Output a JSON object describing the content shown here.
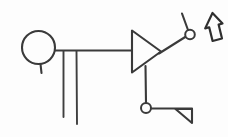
{
  "image": {
    "title": "Hand-drawn schematic sketch",
    "width": 228,
    "height": 137,
    "background_color": "#fdfdfd",
    "ink_color": "#3a3a3a"
  },
  "diagram": {
    "style": "hand-drawn line schematic",
    "elements": [
      {
        "id": "source-circle",
        "name": "circle-source-symbol",
        "label": "",
        "shape": "circle",
        "cx": 38.5,
        "cy": 47.5,
        "r": 16.5
      },
      {
        "id": "source-stub",
        "name": "circle-bottom-stub",
        "label": "",
        "shape": "line",
        "x1": 40.5,
        "y1": 64.0,
        "x2": 41.5,
        "y2": 73.0
      },
      {
        "id": "main-wire",
        "name": "horizontal-main-wire",
        "label": "",
        "shape": "line",
        "x1": 55.0,
        "y1": 50.5,
        "x2": 132.0,
        "y2": 50.5
      },
      {
        "id": "leg-left",
        "name": "vertical-leg-left",
        "label": "",
        "shape": "line",
        "x1": 63.5,
        "y1": 51.0,
        "x2": 63.5,
        "y2": 117.0
      },
      {
        "id": "leg-right",
        "name": "vertical-leg-right",
        "label": "",
        "shape": "line",
        "x1": 76.5,
        "y1": 51.0,
        "x2": 77.0,
        "y2": 124.0
      },
      {
        "id": "amplifier",
        "name": "amplifier-triangle",
        "label": "",
        "shape": "triangle",
        "points": "132,30.5 132,72.5 161,51.5"
      },
      {
        "id": "amp-out-diagonal",
        "name": "output-diagonal-wire",
        "label": "",
        "shape": "line",
        "x1": 159.0,
        "y1": 53.5,
        "x2": 186.0,
        "y2": 36.5
      },
      {
        "id": "top-node",
        "name": "output-node-circle",
        "label": "",
        "shape": "circle",
        "cx": 190.0,
        "cy": 34.5,
        "r": 4.8
      },
      {
        "id": "top-node-stub",
        "name": "output-node-upper-stub",
        "label": "",
        "shape": "line",
        "x1": 188.0,
        "y1": 30.0,
        "x2": 182.0,
        "y2": 13.5
      },
      {
        "id": "amp-down-wire",
        "name": "vertical-feedback-wire",
        "label": "",
        "shape": "line",
        "x1": 145.5,
        "y1": 66.0,
        "x2": 146.0,
        "y2": 103.0
      },
      {
        "id": "bottom-node",
        "name": "bottom-node-circle",
        "label": "",
        "shape": "circle",
        "cx": 146.0,
        "cy": 108.0,
        "r": 5.0
      },
      {
        "id": "bottom-wire",
        "name": "bottom-horizontal-wire",
        "label": "",
        "shape": "line",
        "x1": 151.0,
        "y1": 108.5,
        "x2": 192.0,
        "y2": 108.5
      },
      {
        "id": "ground-triangle",
        "name": "terminator-triangle",
        "label": "",
        "shape": "triangle",
        "points": "175.5,109.0 192.0,109.0 192.0,123.0"
      },
      {
        "id": "cursor-arrow",
        "name": "cursor-arrow-glyph",
        "label": "",
        "shape": "arrow",
        "direction": "up",
        "tilt_deg": -12,
        "points": "212.5,13.0 222.5,23.5 218.6,24.6 222.0,38.5 212.6,41.0 209.2,27.3 205.2,28.4"
      }
    ]
  }
}
